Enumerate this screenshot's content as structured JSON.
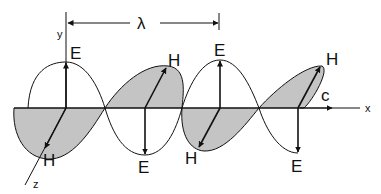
{
  "diagram": {
    "title": "",
    "wavelength_label": "λ",
    "axes": {
      "x": "x",
      "y": "y",
      "z": "z"
    },
    "speed_label": "c",
    "electric_field_label": "E",
    "magnetic_field_label": "H",
    "labels": {
      "e1": "E",
      "e2": "E",
      "e3": "E",
      "e4": "E",
      "h1": "H",
      "h2": "H",
      "h3": "H",
      "h4": "H"
    },
    "colors": {
      "line": "#111111",
      "shading": "#c4c4c4",
      "background": "#ffffff"
    }
  }
}
